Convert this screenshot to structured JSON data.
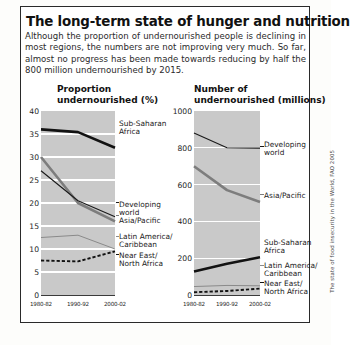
{
  "panel": {
    "title": "The long-term state of hunger and nutrition",
    "intro": "Although the proportion of undernourished people is declining in most regions, the numbers are not improving very much. So far, almost no progress has been made towards reducing by half the 800 million undernourished by 2015.",
    "source": "The state of food insecurity in the World, FAO 2005"
  },
  "chart_data": [
    {
      "type": "line",
      "id": "proportion",
      "title": "Proportion undernourished (%)",
      "title_line1": "Proportion",
      "title_line2": "undernourished (%)",
      "xlabel": "",
      "ylabel": "",
      "categories": [
        "1980-82",
        "1990-92",
        "2000-02"
      ],
      "ylim": [
        0,
        40
      ],
      "yticks": [
        0,
        5,
        10,
        15,
        20,
        25,
        30,
        35,
        40
      ],
      "grid": true,
      "legend": "inline-right",
      "series": [
        {
          "name": "Sub-Saharan Africa",
          "label_line1": "Sub-Saharan",
          "label_line2": "Africa",
          "style": "thick-black",
          "color": "#121212",
          "values": [
            36,
            35.4,
            32
          ]
        },
        {
          "name": "Asia/Pacific",
          "label_line1": "Asia/Pacific",
          "label_line2": "",
          "style": "thick-gray",
          "color": "#7d7d7d",
          "values": [
            30,
            20,
            16
          ]
        },
        {
          "name": "Developing world",
          "label_line1": "Developing",
          "label_line2": "world",
          "style": "thin-black",
          "color": "#1a1a1a",
          "values": [
            27,
            20.5,
            17
          ]
        },
        {
          "name": "Latin America/Caribbean",
          "label_line1": "Latin America/",
          "label_line2": "Caribbean",
          "style": "thin-gray",
          "color": "#8a8a8a",
          "values": [
            12.5,
            13,
            10
          ]
        },
        {
          "name": "Near East/North Africa",
          "label_line1": "Near East/",
          "label_line2": "North Africa",
          "style": "dashed-black",
          "color": "#121212",
          "values": [
            7.5,
            7.3,
            9.5
          ]
        }
      ]
    },
    {
      "type": "line",
      "id": "number",
      "title": "Number of undernourished (millions)",
      "title_line1": "Number of",
      "title_line2": "undernourished (millions)",
      "xlabel": "",
      "ylabel": "",
      "categories": [
        "1980-82",
        "1990-92",
        "2000-02"
      ],
      "ylim": [
        0,
        1000
      ],
      "yticks": [
        0,
        200,
        400,
        600,
        800,
        1000
      ],
      "grid": true,
      "legend": "inline-right",
      "series": [
        {
          "name": "Developing world",
          "label_line1": "Developing",
          "label_line2": "world",
          "style": "thin-black",
          "color": "#1a1a1a",
          "values": [
            880,
            800,
            798
          ]
        },
        {
          "name": "Asia/Pacific",
          "label_line1": "Asia/Pacific",
          "label_line2": "",
          "style": "thick-gray",
          "color": "#7d7d7d",
          "values": [
            700,
            570,
            505
          ]
        },
        {
          "name": "Sub-Saharan Africa",
          "label_line1": "Sub-Saharan",
          "label_line2": "Africa",
          "style": "thick-black",
          "color": "#121212",
          "values": [
            128,
            170,
            205
          ]
        },
        {
          "name": "Latin America/Caribbean",
          "label_line1": "Latin America/",
          "label_line2": "Caribbean",
          "style": "thin-gray",
          "color": "#8a8a8a",
          "values": [
            46,
            52,
            50
          ]
        },
        {
          "name": "Near East/North Africa",
          "label_line1": "Near East/",
          "label_line2": "North Africa",
          "style": "dashed-black",
          "color": "#121212",
          "values": [
            15,
            22,
            35
          ]
        }
      ]
    }
  ]
}
